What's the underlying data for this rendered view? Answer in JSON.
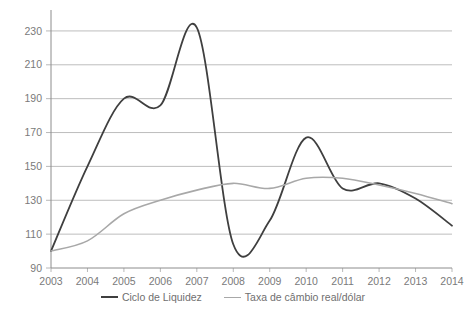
{
  "chart_data": {
    "type": "line",
    "title": "",
    "subtitle": "",
    "xlabel": "",
    "ylabel": "",
    "grid": "horizontal",
    "legend_position": "bottom",
    "xlim": [
      2003,
      2014
    ],
    "ylim": [
      90,
      240
    ],
    "y_axis_display_max": 230,
    "ytick_labels": [
      "90",
      "110",
      "130",
      "150",
      "170",
      "190",
      "210",
      "230"
    ],
    "ytick_values": [
      90,
      110,
      130,
      150,
      170,
      190,
      210,
      230
    ],
    "xtick_labels": [
      "2003",
      "2004",
      "2005",
      "2006",
      "2007",
      "2008",
      "2009",
      "2010",
      "2011",
      "2012",
      "2013",
      "2014"
    ],
    "x": [
      2003,
      2004,
      2005,
      2006,
      2007,
      2008,
      2009,
      2010,
      2011,
      2012,
      2013,
      2014
    ],
    "series": [
      {
        "name": "Ciclo de Liquidez",
        "color": "#3f3f3f",
        "width": 1.8,
        "values": [
          100,
          150,
          190,
          186,
          232,
          104,
          118,
          167,
          137,
          140,
          131,
          115
        ]
      },
      {
        "name": "Taxa de câmbio real/dólar",
        "color": "#a8a8a8",
        "width": 1.6,
        "values": [
          100,
          106,
          122,
          130,
          136,
          140,
          137,
          143,
          143,
          139,
          134,
          128
        ]
      }
    ],
    "annotations": []
  },
  "legend": {
    "entries": [
      {
        "label": "Ciclo de Liquidez",
        "color": "#3f3f3f"
      },
      {
        "label": "Taxa de câmbio real/dólar",
        "color": "#a8a8a8"
      }
    ]
  },
  "caption": {
    "text": ""
  },
  "colors": {
    "series_primary": "#3f3f3f",
    "series_secondary": "#a8a8a8",
    "gridline": "#b5b5b5",
    "axis": "#8c8c8c",
    "tick_text": "#7a7a7a",
    "background": "#ffffff"
  }
}
